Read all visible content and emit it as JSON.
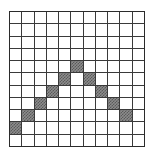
{
  "figure": {
    "grid": {
      "rows": 11,
      "columns": 11,
      "cell_size_px": 12.36,
      "line_color": "#3a3a3a",
      "border_color": "#2b2b2b",
      "background_color": "#ffffff"
    },
    "shading": {
      "fill_color": "#8c8c8c",
      "hatch_color": "#5a5a5a",
      "pattern": "checkered-hatch"
    },
    "shaded_cells": [
      {
        "row": 9,
        "col": 0
      },
      {
        "row": 8,
        "col": 1
      },
      {
        "row": 7,
        "col": 2
      },
      {
        "row": 6,
        "col": 3
      },
      {
        "row": 5,
        "col": 4
      },
      {
        "row": 4,
        "col": 5
      },
      {
        "row": 5,
        "col": 6
      },
      {
        "row": 6,
        "col": 7
      },
      {
        "row": 7,
        "col": 8
      },
      {
        "row": 8,
        "col": 9
      }
    ]
  },
  "chart_data": {
    "type": "heatmap",
    "xlabel": "",
    "ylabel": "",
    "categories": [
      "0",
      "1",
      "2",
      "3",
      "4",
      "5",
      "6",
      "7",
      "8",
      "9",
      "10"
    ],
    "row_labels": [
      "0",
      "1",
      "2",
      "3",
      "4",
      "5",
      "6",
      "7",
      "8",
      "9",
      "10"
    ],
    "xlim": [
      0,
      11
    ],
    "ylim": [
      0,
      11
    ],
    "grid": true,
    "legend": null,
    "values": [
      [
        0,
        0,
        0,
        0,
        0,
        0,
        0,
        0,
        0,
        0,
        0
      ],
      [
        0,
        0,
        0,
        0,
        0,
        0,
        0,
        0,
        0,
        0,
        0
      ],
      [
        0,
        0,
        0,
        0,
        0,
        0,
        0,
        0,
        0,
        0,
        0
      ],
      [
        0,
        0,
        0,
        0,
        0,
        0,
        0,
        0,
        0,
        0,
        0
      ],
      [
        0,
        0,
        0,
        0,
        0,
        1,
        0,
        0,
        0,
        0,
        0
      ],
      [
        0,
        0,
        0,
        0,
        1,
        0,
        1,
        0,
        0,
        0,
        0
      ],
      [
        0,
        0,
        0,
        1,
        0,
        0,
        0,
        1,
        0,
        0,
        0
      ],
      [
        0,
        0,
        1,
        0,
        0,
        0,
        0,
        0,
        1,
        0,
        0
      ],
      [
        0,
        1,
        0,
        0,
        0,
        0,
        0,
        0,
        0,
        1,
        0
      ],
      [
        1,
        0,
        0,
        0,
        0,
        0,
        0,
        0,
        0,
        0,
        0
      ],
      [
        0,
        0,
        0,
        0,
        0,
        0,
        0,
        0,
        0,
        0,
        0
      ]
    ]
  }
}
